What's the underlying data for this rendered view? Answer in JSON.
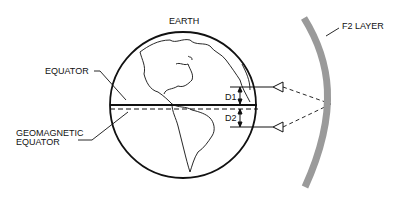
{
  "labels": {
    "earth": "EARTH",
    "f2_layer": "F2 LAYER",
    "equator": "EQUATOR",
    "geomagnetic_line1": "GEOMAGNETIC",
    "geomagnetic_line2": "EQUATOR",
    "d1": "D1",
    "d2": "D2"
  },
  "colors": {
    "f2_layer": "#9a9a9a",
    "ink": "#111111"
  }
}
